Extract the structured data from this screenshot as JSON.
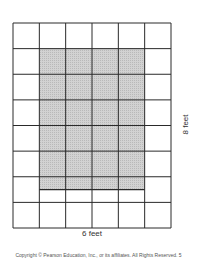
{
  "diagram": {
    "grid": {
      "columns": 6,
      "rows": 8,
      "left": 13,
      "top": 23,
      "width": 158,
      "height": 205,
      "line_color": "#2a2a2a"
    },
    "shaded_region": {
      "col_start": 1,
      "col_end": 5,
      "row_start": 1,
      "row_end": 6.5,
      "fill_color": "#c8c8c8"
    },
    "width_label": "6 feet",
    "height_label": "8 feet"
  },
  "footer": {
    "copyright": "Copyright © Pearson Education, Inc., or its affiliates. All Rights Reserved.",
    "page_number": "5"
  }
}
